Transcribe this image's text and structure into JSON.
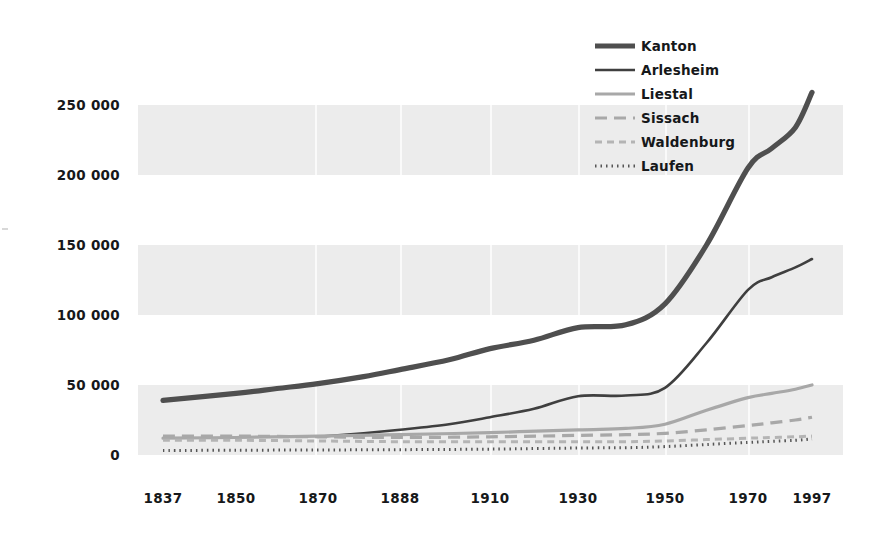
{
  "chart_data": {
    "type": "line",
    "title": "",
    "subtitle": "",
    "xlabel": "",
    "ylabel": "",
    "xlim": [
      1837,
      1997
    ],
    "ylim": [
      0,
      275000
    ],
    "grid": "horizontal-banded",
    "legend_position": "top-right",
    "x_tick_labels": [
      "1837",
      "1850",
      "1870",
      "1888",
      "1910",
      "1930",
      "1950",
      "1970",
      "1997"
    ],
    "x_tick_values": [
      1837,
      1850,
      1870,
      1888,
      1910,
      1930,
      1950,
      1970,
      1997
    ],
    "y_tick_labels": [
      "250 000",
      "200 000",
      "150 000",
      "100 000",
      "50 000",
      "0"
    ],
    "y_tick_values": [
      250000,
      200000,
      150000,
      100000,
      50000,
      0
    ],
    "series": [
      {
        "name": "Kanton",
        "color": "#4f4f4f",
        "width": 5.2,
        "dash": "none",
        "x": [
          1837,
          1850,
          1860,
          1870,
          1880,
          1888,
          1900,
          1910,
          1920,
          1930,
          1941,
          1950,
          1960,
          1970,
          1980,
          1990,
          1997
        ],
        "values": [
          39000,
          44000,
          47500,
          51000,
          56000,
          61000,
          68000,
          76000,
          82000,
          91000,
          93000,
          108000,
          150000,
          205000,
          219000,
          234000,
          259000
        ]
      },
      {
        "name": "Arlesheim",
        "color": "#3f3f3f",
        "width": 2.6,
        "dash": "none",
        "x": [
          1870,
          1880,
          1888,
          1900,
          1910,
          1920,
          1930,
          1941,
          1950,
          1960,
          1970,
          1980,
          1990,
          1997
        ],
        "values": [
          13000,
          15500,
          18000,
          22000,
          27000,
          33000,
          42000,
          42500,
          48000,
          80000,
          118000,
          127000,
          134000,
          140000
        ]
      },
      {
        "name": "Liestal",
        "color": "#a8a8a8",
        "width": 3.2,
        "dash": "none",
        "x": [
          1837,
          1850,
          1870,
          1888,
          1910,
          1930,
          1941,
          1950,
          1960,
          1970,
          1980,
          1990,
          1997
        ],
        "values": [
          12000,
          12500,
          13500,
          14500,
          16000,
          18000,
          19000,
          22000,
          32000,
          41000,
          44000,
          47000,
          50000
        ]
      },
      {
        "name": "Sissach",
        "color": "#a8a8a8",
        "width": 3.2,
        "dash": "12,7",
        "x": [
          1837,
          1850,
          1870,
          1888,
          1910,
          1930,
          1941,
          1950,
          1960,
          1970,
          1980,
          1990,
          1997
        ],
        "values": [
          13500,
          13500,
          13000,
          12500,
          13000,
          14000,
          14500,
          15500,
          18000,
          21000,
          23000,
          25000,
          27000
        ]
      },
      {
        "name": "Waldenburg",
        "color": "#b4b4b4",
        "width": 3.0,
        "dash": "7,5",
        "x": [
          1837,
          1850,
          1870,
          1888,
          1910,
          1930,
          1941,
          1950,
          1960,
          1970,
          1980,
          1990,
          1997
        ],
        "values": [
          10500,
          10500,
          10000,
          9500,
          9500,
          9500,
          9500,
          10000,
          11000,
          12000,
          12500,
          13000,
          13500
        ]
      },
      {
        "name": "Laufen",
        "color": "#555555",
        "width": 3.0,
        "dash": "1.5,4",
        "x": [
          1837,
          1850,
          1870,
          1888,
          1910,
          1930,
          1941,
          1950,
          1960,
          1970,
          1980,
          1990,
          1997
        ],
        "values": [
          3200,
          3400,
          3600,
          3800,
          4200,
          5000,
          5200,
          6000,
          7500,
          9000,
          9800,
          10500,
          11500
        ]
      }
    ]
  },
  "legend": {
    "items": [
      {
        "label": "Kanton"
      },
      {
        "label": "Arlesheim"
      },
      {
        "label": "Liestal"
      },
      {
        "label": "Sissach"
      },
      {
        "label": "Waldenburg"
      },
      {
        "label": "Laufen"
      }
    ]
  }
}
